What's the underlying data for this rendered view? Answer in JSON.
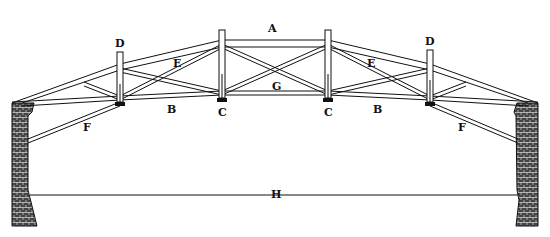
{
  "figure": {
    "ink_color": "#111111",
    "paper_color": "#ffffff",
    "labels": [
      {
        "id": "A",
        "text": "A",
        "x": 273,
        "y": 32
      },
      {
        "id": "D_left",
        "text": "D",
        "x": 120,
        "y": 46
      },
      {
        "id": "D_right",
        "text": "D",
        "x": 430,
        "y": 44
      },
      {
        "id": "E_left",
        "text": "E",
        "x": 178,
        "y": 66
      },
      {
        "id": "E_right",
        "text": "E",
        "x": 372,
        "y": 66
      },
      {
        "id": "G",
        "text": "G",
        "x": 276,
        "y": 90
      },
      {
        "id": "B_left",
        "text": "B",
        "x": 172,
        "y": 112
      },
      {
        "id": "C_left",
        "text": "C",
        "x": 225,
        "y": 114
      },
      {
        "id": "C_right",
        "text": "C",
        "x": 330,
        "y": 114
      },
      {
        "id": "B_right",
        "text": "B",
        "x": 378,
        "y": 112
      },
      {
        "id": "F_left",
        "text": "F",
        "x": 88,
        "y": 130
      },
      {
        "id": "F_right",
        "text": "F",
        "x": 463,
        "y": 130
      },
      {
        "id": "H",
        "text": "H",
        "x": 276,
        "y": 196
      }
    ]
  }
}
